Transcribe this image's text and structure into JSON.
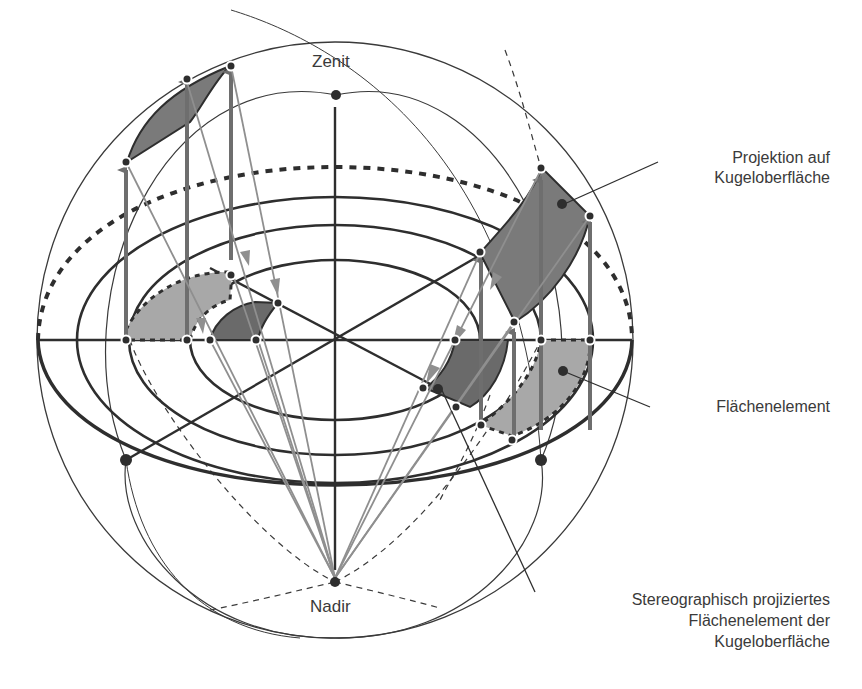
{
  "diagram": {
    "poles": {
      "zenith": {
        "label": "Zenit",
        "x": 336,
        "y": 95
      },
      "nadir": {
        "label": "Nadir",
        "x": 335,
        "y": 582
      }
    },
    "callouts": [
      {
        "id": "projection",
        "lines": [
          "Projektion auf",
          "Kugeloberfläche"
        ],
        "target": [
          562,
          205
        ]
      },
      {
        "id": "area-element",
        "lines": [
          "Flächenelement"
        ],
        "target": [
          563,
          371
        ]
      },
      {
        "id": "stereo-projected",
        "lines": [
          "Stereographisch projiziertes",
          "Flächenelement der",
          "Kugeloberfläche"
        ],
        "target": [
          440,
          386
        ]
      }
    ],
    "colors": {
      "line": "#2e2e2e",
      "arrow": "#6e6e6e",
      "projection_line": "#8a8a8a",
      "surface_patch": "#7a7a7a",
      "flat_patch": "#a8a8a8",
      "stereo_patch": "#6a6a6a",
      "text": "#3a3a3a"
    },
    "sphere": {
      "cx": 335,
      "cy": 340,
      "r": 298
    }
  }
}
